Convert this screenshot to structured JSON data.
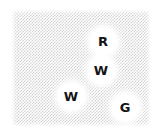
{
  "canvas": {
    "width": 156,
    "height": 134,
    "background_color": "#ffffff"
  },
  "field": {
    "name": "dithered-background-field",
    "x": 12,
    "y": 10,
    "width": 138,
    "height": 116,
    "pattern": "checkerboard-dither",
    "cell_size_px": 1.5,
    "light_color": "#ffffff",
    "dark_color": "#d2d2d2"
  },
  "markers": [
    {
      "id": "marker-r",
      "label": "R",
      "x": 103,
      "y": 41,
      "radius": 11.5,
      "fill_color": "#ffffff",
      "text_color": "#141414"
    },
    {
      "id": "marker-w-1",
      "label": "W",
      "x": 101,
      "y": 70,
      "radius": 11.5,
      "fill_color": "#ffffff",
      "text_color": "#141414"
    },
    {
      "id": "marker-w-2",
      "label": "W",
      "x": 71,
      "y": 96,
      "radius": 11.5,
      "fill_color": "#ffffff",
      "text_color": "#141414"
    },
    {
      "id": "marker-g",
      "label": "G",
      "x": 125,
      "y": 107,
      "radius": 11.5,
      "fill_color": "#ffffff",
      "text_color": "#141414"
    }
  ]
}
